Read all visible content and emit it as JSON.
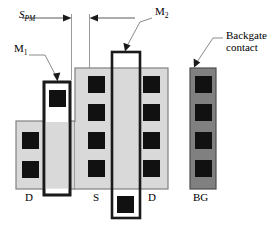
{
  "figure": {
    "colors": {
      "background": "#ffffff",
      "active_region_fill": "#d9d9d9",
      "active_region_stroke": "#808080",
      "backgate_fill": "#808080",
      "backgate_stroke": "#4d4d4d",
      "contact_fill": "#111111",
      "metal_stroke": "#000000",
      "dimension_line": "#808080",
      "leader_line": "#888888",
      "text": "#000000"
    },
    "labels": {
      "spm": {
        "base": "S",
        "sub": "PM"
      },
      "m1": {
        "base": "M",
        "sub": "1"
      },
      "m2": {
        "base": "M",
        "sub": "2"
      },
      "backgate_line1": "Backgate",
      "backgate_line2": "contact",
      "terminal_drain_left": "D",
      "terminal_source": "S",
      "terminal_drain_right": "D",
      "terminal_backgate": "BG"
    },
    "geometry": {
      "left_active": {
        "x": 16,
        "y": 121,
        "w": 59,
        "h": 68
      },
      "center_active": {
        "x": 75,
        "y": 68,
        "w": 93,
        "h": 121
      },
      "backgate_bar": {
        "x": 190,
        "y": 68,
        "w": 26,
        "h": 121
      },
      "metal_m1": {
        "x": 44,
        "y": 82,
        "w": 26,
        "h": 113
      },
      "metal_m2": {
        "x": 112,
        "y": 52,
        "w": 28,
        "h": 166
      }
    },
    "contacts": {
      "left_column": [
        {
          "x": 22,
          "y": 132,
          "size": 17
        },
        {
          "x": 22,
          "y": 161,
          "size": 17
        }
      ],
      "m1_column": [
        {
          "x": 49,
          "y": 90,
          "size": 17
        }
      ],
      "center_left_column": [
        {
          "x": 88,
          "y": 76,
          "size": 17
        },
        {
          "x": 88,
          "y": 104,
          "size": 17
        },
        {
          "x": 88,
          "y": 132,
          "size": 17
        },
        {
          "x": 88,
          "y": 160,
          "size": 17
        }
      ],
      "center_right_column": [
        {
          "x": 143,
          "y": 76,
          "size": 17
        },
        {
          "x": 143,
          "y": 104,
          "size": 17
        },
        {
          "x": 143,
          "y": 132,
          "size": 17
        },
        {
          "x": 143,
          "y": 160,
          "size": 17
        }
      ],
      "m2_bottom_column": [
        {
          "x": 117,
          "y": 196,
          "size": 17
        }
      ],
      "backgate_column": [
        {
          "x": 195,
          "y": 76,
          "size": 17
        },
        {
          "x": 195,
          "y": 104,
          "size": 17
        },
        {
          "x": 195,
          "y": 132,
          "size": 17
        },
        {
          "x": 195,
          "y": 160,
          "size": 17
        }
      ]
    }
  }
}
